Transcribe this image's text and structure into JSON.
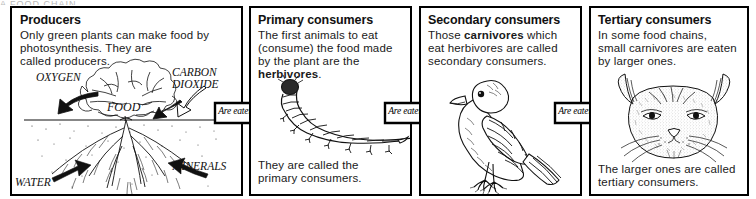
{
  "page": {
    "title_cut_off": "A FOOD CHAIN",
    "background": "#ffffff",
    "ink": "#000000"
  },
  "panels": [
    {
      "id": "producers",
      "title": "Producers",
      "body_lines": [
        "Only green plants can make food by",
        "photosynthesis. They are",
        "called producers."
      ],
      "footer": "",
      "illustration": "plant-with-roots-illustration",
      "illustration_labels": [
        {
          "name": "oxygen-label",
          "text": "OXYGEN"
        },
        {
          "name": "carbon-dioxide-label",
          "text": "CARBON"
        },
        {
          "name": "carbon-dioxide-label-2",
          "text": "DIOXIDE"
        },
        {
          "name": "food-label",
          "text": "FOOD"
        },
        {
          "name": "water-label",
          "text": "WATER"
        },
        {
          "name": "minerals-label",
          "text": "MINERALS"
        }
      ]
    },
    {
      "id": "primary-consumers",
      "title": "Primary consumers",
      "body_lines": [
        "The first animals to eat",
        "(consume) the food made",
        "by the plant are the"
      ],
      "body_bold": "herbivores",
      "body_bold_tail": ".",
      "footer_lines": [
        "They are called the",
        "primary consumers."
      ],
      "illustration": "caterpillar-illustration"
    },
    {
      "id": "secondary-consumers",
      "title": "Secondary consumers",
      "body_lead": "Those ",
      "body_bold": "carnivores",
      "body_tail": " which",
      "body_lines": [
        "eat herbivores are called",
        "secondary consumers."
      ],
      "footer": "",
      "illustration": "bird-illustration"
    },
    {
      "id": "tertiary-consumers",
      "title": "Tertiary consumers",
      "body_lines": [
        "In some food chains,",
        "small carnivores are eaten",
        "by larger ones."
      ],
      "footer_lines": [
        "The larger ones are called",
        "tertiary consumers."
      ],
      "illustration": "cat-head-illustration"
    }
  ],
  "arrows": [
    {
      "id": "arrow-1",
      "label": "Are eaten by"
    },
    {
      "id": "arrow-2",
      "label": "Are eaten by"
    },
    {
      "id": "arrow-3",
      "label": "Are eaten by"
    }
  ]
}
